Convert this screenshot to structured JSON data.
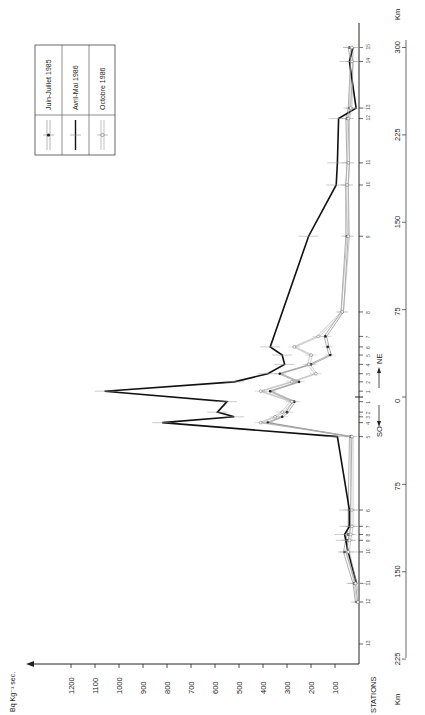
{
  "chart_data": {
    "type": "line",
    "orientation": "rotated-90-ccw",
    "title": "",
    "ylabel": "Bq Kg-1 sec.",
    "xlabel": "Km",
    "station_axis_label": "STATIONS",
    "direction_label": {
      "left": "SO",
      "right": "NE"
    },
    "ylim": [
      0,
      1250
    ],
    "y_ticks": [
      100,
      200,
      300,
      400,
      500,
      600,
      700,
      800,
      900,
      1000,
      1100,
      1200
    ],
    "km_ticks": [
      {
        "label": "225",
        "km": -225
      },
      {
        "label": "150",
        "km": -150
      },
      {
        "label": "75",
        "km": -75
      },
      {
        "label": "0",
        "km": 0
      },
      {
        "label": "75",
        "km": 75
      },
      {
        "label": "150",
        "km": 150
      },
      {
        "label": "225",
        "km": 225
      },
      {
        "label": "300",
        "km": 300
      }
    ],
    "stations": [
      {
        "label": "13",
        "side": "SO",
        "km": -212
      },
      {
        "label": "12",
        "side": "SO",
        "km": -176
      },
      {
        "label": "11",
        "side": "SO",
        "km": -160
      },
      {
        "label": "10",
        "side": "SO",
        "km": -133
      },
      {
        "label": "9",
        "side": "SO",
        "km": -123
      },
      {
        "label": "8",
        "side": "SO",
        "km": -118
      },
      {
        "label": "7",
        "side": "SO",
        "km": -111
      },
      {
        "label": "6",
        "side": "SO",
        "km": -97
      },
      {
        "label": "5",
        "side": "SO",
        "km": -34
      },
      {
        "label": "4",
        "side": "SO",
        "km": -22
      },
      {
        "label": "3",
        "side": "SO",
        "km": -17
      },
      {
        "label": "2",
        "side": "SO",
        "km": -13
      },
      {
        "label": "1",
        "side": "SO",
        "km": -4
      },
      {
        "label": "1",
        "side": "NE",
        "km": 5
      },
      {
        "label": "2",
        "side": "NE",
        "km": 13
      },
      {
        "label": "3",
        "side": "NE",
        "km": 20
      },
      {
        "label": "4",
        "side": "NE",
        "km": 28
      },
      {
        "label": "5",
        "side": "NE",
        "km": 36
      },
      {
        "label": "6",
        "side": "NE",
        "km": 43
      },
      {
        "label": "7",
        "side": "NE",
        "km": 52
      },
      {
        "label": "8",
        "side": "NE",
        "km": 73
      },
      {
        "label": "9",
        "side": "NE",
        "km": 138
      },
      {
        "label": "10",
        "side": "NE",
        "km": 182
      },
      {
        "label": "11",
        "side": "NE",
        "km": 201
      },
      {
        "label": "12",
        "side": "NE",
        "km": 239
      },
      {
        "label": "13",
        "side": "NE",
        "km": 248
      },
      {
        "label": "14",
        "side": "NE",
        "km": 288
      },
      {
        "label": "15",
        "side": "NE",
        "km": 300
      }
    ],
    "series": [
      {
        "name": "Juin-Juillet 1985",
        "style": "double-line-filled-dot",
        "km": [
          -176,
          -160,
          -133,
          -123,
          -118,
          -111,
          -97,
          -34,
          -22,
          -17,
          -13,
          -4,
          5,
          13,
          20,
          28,
          36,
          43,
          52,
          73,
          138,
          182,
          201,
          239,
          248,
          288,
          300
        ],
        "values": [
          10,
          20,
          60,
          50,
          45,
          40,
          40,
          35,
          380,
          320,
          300,
          270,
          370,
          250,
          330,
          200,
          120,
          130,
          140,
          70,
          50,
          50,
          45,
          50,
          40,
          30,
          40
        ]
      },
      {
        "name": "Avril-Mai 1986",
        "style": "bold-line",
        "km": [
          -160,
          -133,
          -123,
          -118,
          -111,
          -97,
          -34,
          -22,
          -17,
          -13,
          -4,
          5,
          13,
          20,
          28,
          36,
          43,
          138,
          182,
          201,
          239,
          248,
          288,
          300
        ],
        "values": [
          10,
          45,
          55,
          60,
          40,
          40,
          90,
          820,
          520,
          590,
          550,
          1060,
          520,
          380,
          310,
          320,
          370,
          210,
          95,
          90,
          85,
          12,
          40,
          25
        ]
      },
      {
        "name": "Octobre 1986",
        "style": "double-line-open-circle",
        "km": [
          -176,
          -160,
          -133,
          -123,
          -118,
          -111,
          -97,
          -34,
          -22,
          -17,
          -13,
          -4,
          5,
          13,
          20,
          28,
          36,
          43,
          52,
          73,
          138,
          182,
          201,
          239,
          248,
          288,
          300
        ],
        "values": [
          15,
          25,
          55,
          50,
          45,
          40,
          40,
          40,
          420,
          360,
          330,
          290,
          420,
          290,
          190,
          220,
          210,
          280,
          180,
          80,
          55,
          60,
          55,
          55,
          45,
          40,
          40
        ]
      }
    ],
    "legend": {
      "position": "upper-left (rotated)",
      "entries": [
        "Juin-Juillet 1985",
        "Avril-Mai 1986",
        "Octobre 1986"
      ]
    },
    "grid": false
  },
  "labels": {
    "unit": "Bq Kg⁻¹ sec.",
    "stations": "STATIONS",
    "km": "Km",
    "so": "SO",
    "ne": "NE",
    "legend_1": "Juin-Juillet 1985",
    "legend_2": "Avril-Mai 1986",
    "legend_3": "Octobre 1986"
  }
}
